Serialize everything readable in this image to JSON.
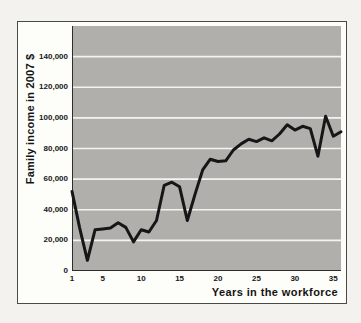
{
  "figure": {
    "page_background": "#f3f2ee",
    "frame_background": "#fdfdfa",
    "frame_border_color": "#4a4a48",
    "plot_background": "#b1afac",
    "gridline_color": "#f4f3f0",
    "axis_line_color": "#2e2e2c",
    "series_line_color": "#161616",
    "text_color": "#171717"
  },
  "chart_data": {
    "type": "line",
    "title": "",
    "xlabel": "Years in the workforce",
    "ylabel": "Family income in 2007 $",
    "x": [
      1,
      2,
      3,
      4,
      5,
      6,
      7,
      8,
      9,
      10,
      11,
      12,
      13,
      14,
      15,
      16,
      17,
      18,
      19,
      20,
      21,
      22,
      23,
      24,
      25,
      26,
      27,
      28,
      29,
      30,
      31,
      32,
      33,
      34,
      35,
      36
    ],
    "values": [
      52000,
      28000,
      7000,
      27000,
      27500,
      28000,
      31500,
      28500,
      19000,
      27000,
      25500,
      33000,
      56000,
      58000,
      55000,
      33000,
      50000,
      66000,
      73000,
      71500,
      72000,
      79000,
      83000,
      86000,
      84500,
      87000,
      85000,
      89500,
      95500,
      92000,
      94500,
      93000,
      75000,
      101000,
      88000,
      91000
    ],
    "xlim": [
      1,
      36
    ],
    "ylim": [
      0,
      160000
    ],
    "x_ticks": [
      1,
      5,
      10,
      15,
      20,
      25,
      30,
      35
    ],
    "x_tick_labels": [
      "1",
      "5",
      "10",
      "15",
      "20",
      "25",
      "30",
      "35"
    ],
    "y_ticks": [
      0,
      20000,
      40000,
      60000,
      80000,
      100000,
      120000,
      140000
    ],
    "y_tick_labels": [
      "0",
      "20,000",
      "40,000",
      "60,000",
      "80,000",
      "100,000",
      "120,000",
      "140,000"
    ],
    "grid": "horizontal",
    "legend": "none",
    "series_name": "Family income"
  }
}
